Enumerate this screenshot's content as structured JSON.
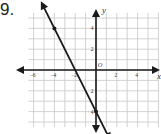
{
  "problem": {
    "number": "9."
  },
  "chart_data": {
    "type": "line",
    "title": "",
    "xlabel": "x",
    "ylabel": "y",
    "origin_label": "O",
    "x_tick_labels": [
      "-6",
      "-4",
      "-2",
      "2",
      "4"
    ],
    "y_tick_labels": [
      "4",
      "2",
      "-2",
      "-4"
    ],
    "xlim": [
      -6.5,
      6
    ],
    "ylim": [
      -5.5,
      5.5
    ],
    "grid": true,
    "grid_step": 1,
    "series": [
      {
        "name": "line",
        "points": [
          [
            -4,
            4
          ],
          [
            0,
            -4
          ]
        ],
        "slope": -2,
        "y_intercept": -4,
        "x_intercept": -2
      }
    ],
    "marked_points": [
      [
        -4,
        4
      ],
      [
        0,
        -4
      ]
    ]
  },
  "colors": {
    "grid": "#c8c8c8",
    "axis": "#1a1a1a",
    "line": "#1a1a1a",
    "label": "#333333"
  }
}
